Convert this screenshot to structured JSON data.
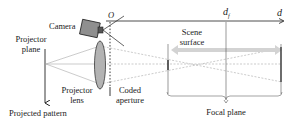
{
  "diagram": {
    "labels": {
      "camera": "Camera",
      "origin": "O",
      "projector_plane_line1": "Projector",
      "projector_plane_line2": "plane",
      "projector_lens_line1": "Projector",
      "projector_lens_line2": "lens",
      "coded_aperture_line1": "Coded",
      "coded_aperture_line2": "aperture",
      "projected_pattern": "Projected pattern",
      "scene_surface_line1": "Scene",
      "scene_surface_line2": "surface",
      "focal_plane": "Focal plane",
      "depth_focus": "d",
      "depth_focus_subscript": "f",
      "depth_axis": "d"
    },
    "colors": {
      "line": "#222222",
      "guide": "#a8a8a8",
      "lens_fill": "#b3b3b3",
      "camera_fill": "#8f8f8f",
      "surface_arrow": "#cfcfcf"
    }
  }
}
